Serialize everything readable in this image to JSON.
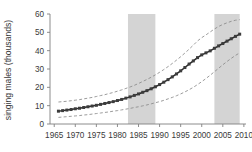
{
  "chart_data": {
    "type": "line",
    "title": "",
    "xlabel": "",
    "ylabel": "singing males (thousands)",
    "xlim": [
      1964,
      2010.5
    ],
    "ylim": [
      0,
      60
    ],
    "xticks": [
      1965,
      1970,
      1975,
      1980,
      1985,
      1990,
      1995,
      2000,
      2005,
      2010
    ],
    "yticks": [
      0,
      10,
      20,
      30,
      40,
      50,
      60
    ],
    "grid": false,
    "legend": "none",
    "x": [
      1966,
      1967,
      1968,
      1969,
      1970,
      1971,
      1972,
      1973,
      1974,
      1975,
      1976,
      1977,
      1978,
      1979,
      1980,
      1981,
      1982,
      1983,
      1984,
      1985,
      1986,
      1987,
      1988,
      1989,
      1990,
      1991,
      1992,
      1993,
      1994,
      1995,
      1996,
      1997,
      1998,
      1999,
      2000,
      2001,
      2002,
      2003,
      2004,
      2005,
      2006,
      2007,
      2008,
      2009
    ],
    "series": [
      {
        "name": "estimate",
        "style": "line-with-markers",
        "values": [
          7.0,
          7.3,
          7.6,
          7.9,
          8.3,
          8.6,
          9.0,
          9.4,
          9.8,
          10.2,
          10.7,
          11.2,
          11.7,
          12.2,
          12.8,
          13.4,
          14.1,
          14.8,
          15.6,
          16.4,
          17.3,
          18.2,
          19.2,
          20.3,
          21.5,
          22.8,
          24.2,
          25.7,
          27.3,
          29.0,
          30.8,
          32.7,
          34.4,
          36.2,
          37.7,
          38.8,
          39.9,
          41.3,
          42.6,
          43.9,
          45.2,
          46.5,
          47.8,
          49.0
        ]
      },
      {
        "name": "upper confidence limit",
        "style": "dashed",
        "values": [
          12.0,
          12.2,
          12.4,
          12.7,
          13.0,
          13.3,
          13.7,
          14.1,
          14.5,
          15.0,
          15.5,
          16.0,
          16.6,
          17.2,
          17.9,
          18.6,
          19.4,
          20.2,
          21.1,
          22.1,
          23.2,
          24.3,
          25.5,
          26.8,
          28.2,
          29.7,
          31.3,
          33.0,
          34.8,
          36.7,
          38.7,
          40.8,
          43.0,
          45.3,
          47.1,
          48.6,
          50.2,
          51.8,
          53.2,
          54.3,
          55.2,
          56.0,
          56.6,
          56.9
        ]
      },
      {
        "name": "lower confidence limit",
        "style": "dashed",
        "values": [
          3.6,
          3.8,
          4.0,
          4.2,
          4.4,
          4.6,
          4.9,
          5.1,
          5.4,
          5.7,
          6.0,
          6.3,
          6.6,
          7.0,
          7.3,
          7.7,
          8.1,
          8.5,
          9.0,
          9.4,
          9.9,
          10.4,
          11.0,
          11.6,
          12.2,
          12.9,
          13.7,
          14.5,
          15.4,
          16.4,
          17.5,
          18.7,
          20.0,
          21.5,
          23.1,
          24.8,
          26.6,
          28.5,
          30.4,
          32.3,
          34.1,
          35.8,
          37.4,
          38.8
        ]
      }
    ],
    "shaded_bands": [
      {
        "name": "band-1",
        "x_start": 1982.5,
        "x_end": 1989.0,
        "color": "#d4d4d4"
      },
      {
        "name": "band-2",
        "x_start": 2003.0,
        "x_end": 2009.0,
        "color": "#d4d4d4"
      }
    ]
  }
}
